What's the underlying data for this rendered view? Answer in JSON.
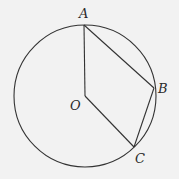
{
  "diagram": {
    "type": "geometry-circle",
    "colors": {
      "background": "#f2f2f2",
      "stroke": "#333333",
      "label": "#2a2a2a"
    },
    "circle": {
      "center": "O",
      "cx": 85,
      "cy": 96,
      "r": 71
    },
    "points": {
      "A": {
        "label": "A",
        "x": 84,
        "y": 25,
        "label_x": 79,
        "label_y": 18
      },
      "B": {
        "label": "B",
        "x": 154,
        "y": 88,
        "label_x": 158,
        "label_y": 93
      },
      "C": {
        "label": "C",
        "x": 134,
        "y": 147,
        "label_x": 135,
        "label_y": 163
      },
      "O": {
        "label": "O",
        "x": 85,
        "y": 96,
        "label_x": 70,
        "label_y": 110
      }
    },
    "segments": [
      {
        "from": "A",
        "to": "O"
      },
      {
        "from": "O",
        "to": "C"
      },
      {
        "from": "A",
        "to": "B"
      },
      {
        "from": "B",
        "to": "C"
      }
    ]
  }
}
